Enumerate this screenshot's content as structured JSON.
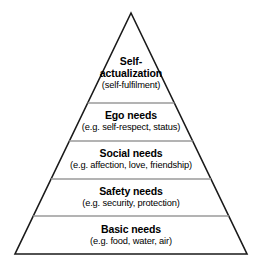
{
  "diagram": {
    "type": "pyramid",
    "name": "maslow-hierarchy-of-needs",
    "background_color": "#ffffff",
    "outline_color": "#1a1a1a",
    "divider_color": "#9a9a9a",
    "text_color": "#000000",
    "geometry": {
      "apex": [
        131,
        13
      ],
      "base_left": [
        15,
        254
      ],
      "base_right": [
        247,
        254
      ],
      "divider_y": [
        103,
        141,
        179,
        216
      ]
    },
    "tiers": [
      {
        "id": "self-actualization",
        "level": 5,
        "title": "Self-\nactualization",
        "title_line1": "Self-",
        "title_line2": "actualization",
        "subtitle": "(self-fulfilment)"
      },
      {
        "id": "ego-needs",
        "level": 4,
        "title": "Ego needs",
        "subtitle": "(e.g. self-respect, status)"
      },
      {
        "id": "social-needs",
        "level": 3,
        "title": "Social needs",
        "subtitle": "(e.g. affection, love, friendship)"
      },
      {
        "id": "safety-needs",
        "level": 2,
        "title": "Safety needs",
        "subtitle": "(e.g. security, protection)"
      },
      {
        "id": "basic-needs",
        "level": 1,
        "title": "Basic needs",
        "subtitle": "(e.g. food, water, air)"
      }
    ]
  }
}
